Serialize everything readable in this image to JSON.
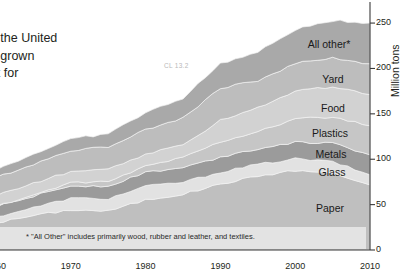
{
  "article": {
    "heading": "d.",
    "lines": [
      "aste in the United",
      "s have grown",
      "e worst for",
      "new"
    ]
  },
  "watermark": "CL 13.2",
  "footnote": "* \"All Other\" includes primarily wood, rubber and leather, and textiles.",
  "axis": {
    "y_title": "Million tons",
    "y_ticks": [
      "0",
      "50",
      "100",
      "150",
      "200",
      "250"
    ],
    "x_ticks": [
      "1960",
      "1970",
      "1980",
      "1990",
      "2000",
      "2010"
    ]
  },
  "band_labels": {
    "all_other": "All other*",
    "yard": "Yard",
    "food": "Food",
    "plastics": "Plastics",
    "metals": "Metals",
    "glass": "Glass",
    "paper": "Paper"
  },
  "colors": {
    "all_other": "#a9a9a9",
    "yard": "#bdbdbd",
    "food": "#d2d2d2",
    "plastics": "#c6c6c6",
    "metals": "#9b9b9b",
    "glass": "#e2e2e2",
    "paper": "#bfbfbf",
    "axis": "#3a3a3a",
    "footnote_band": "#e3e3e3",
    "text": "#231f20"
  },
  "chart_data": {
    "type": "area",
    "xlabel": "",
    "ylabel": "Million tons",
    "xlim": [
      1960,
      2010
    ],
    "ylim": [
      0,
      260
    ],
    "ytick_values": [
      0,
      50,
      100,
      150,
      200,
      250
    ],
    "xtick_values": [
      1960,
      1970,
      1980,
      1990,
      2000,
      2010
    ],
    "grid": false,
    "legend": "inline-band-labels",
    "stacked": true,
    "x": [
      1960,
      1965,
      1970,
      1975,
      1980,
      1985,
      1990,
      1995,
      2000,
      2005,
      2010
    ],
    "series": [
      {
        "name": "Paper",
        "values": [
          29.9,
          38.0,
          44.3,
          43.0,
          55.2,
          61.5,
          72.7,
          81.5,
          87.7,
          84.8,
          71.3
        ]
      },
      {
        "name": "Glass",
        "values": [
          6.7,
          8.7,
          12.7,
          13.5,
          15.1,
          13.2,
          13.1,
          12.8,
          12.8,
          12.5,
          11.5
        ]
      },
      {
        "name": "Metals",
        "values": [
          10.8,
          12.7,
          13.8,
          14.0,
          15.5,
          15.9,
          16.6,
          17.5,
          18.5,
          20.0,
          22.4
        ]
      },
      {
        "name": "Plastics",
        "values": [
          0.4,
          1.4,
          3.0,
          4.5,
          6.8,
          11.5,
          17.1,
          18.9,
          25.5,
          29.4,
          31.4
        ]
      },
      {
        "name": "Food",
        "values": [
          12.2,
          12.7,
          12.8,
          13.4,
          13.0,
          13.2,
          23.9,
          26.1,
          30.7,
          32.9,
          34.8
        ]
      },
      {
        "name": "Yard",
        "values": [
          20.0,
          21.0,
          23.2,
          25.2,
          27.5,
          30.0,
          35.0,
          29.8,
          30.5,
          32.1,
          33.4
        ]
      },
      {
        "name": "All other*",
        "values": [
          8.3,
          11.0,
          12.5,
          14.5,
          18.0,
          22.0,
          27.0,
          31.0,
          37.0,
          41.0,
          45.2
        ]
      }
    ],
    "totals": [
      88.1,
      104.4,
      121.1,
      127.8,
      151.6,
      166.3,
      208.3,
      217.3,
      243.5,
      252.4,
      250.0
    ],
    "annotation": "* \"All Other\" includes primarily wood, rubber and leather, and textiles."
  }
}
